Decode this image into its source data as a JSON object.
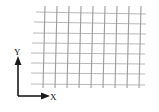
{
  "figure": {
    "title": "",
    "background_color": "#ffffff",
    "width": 159,
    "height": 112
  },
  "axes": {
    "origin": {
      "x": 18,
      "y": 96
    },
    "color": "#1a1a1a",
    "line_width": 1.6,
    "y_axis": {
      "label": "Y",
      "label_position": {
        "x": 14,
        "y": 55
      },
      "direction": "up",
      "arrow": "filled-triangle",
      "start": {
        "x": 18,
        "y": 96
      },
      "end": {
        "x": 18,
        "y": 60
      }
    },
    "x_axis": {
      "label": "X",
      "label_position": {
        "x": 50,
        "y": 100
      },
      "direction": "right",
      "arrow": "filled-triangle",
      "start": {
        "x": 18,
        "y": 96
      },
      "end": {
        "x": 46,
        "y": 96
      }
    }
  },
  "grid": {
    "description": "mesh-grid",
    "color_horizontal": "#b9b9b9",
    "color_vertical": "#9b9b9b",
    "line_width": 1.1,
    "horizontal_line_count": 8,
    "vertical_line_count": 9,
    "horizontal_lines": [
      {
        "x1": 36,
        "y1": 12,
        "x2": 146,
        "y2": 14
      },
      {
        "x1": 34,
        "y1": 22,
        "x2": 146,
        "y2": 24
      },
      {
        "x1": 33,
        "y1": 33,
        "x2": 146,
        "y2": 34
      },
      {
        "x1": 32,
        "y1": 43,
        "x2": 145,
        "y2": 44
      },
      {
        "x1": 31,
        "y1": 53,
        "x2": 145,
        "y2": 54
      },
      {
        "x1": 31,
        "y1": 63,
        "x2": 145,
        "y2": 64
      },
      {
        "x1": 31,
        "y1": 73,
        "x2": 145,
        "y2": 74
      },
      {
        "x1": 31,
        "y1": 84,
        "x2": 145,
        "y2": 85
      }
    ],
    "vertical_lines": [
      {
        "x1": 45,
        "y1": 6,
        "x2": 43,
        "y2": 88
      },
      {
        "x1": 57,
        "y1": 6,
        "x2": 55,
        "y2": 88
      },
      {
        "x1": 69,
        "y1": 6,
        "x2": 67,
        "y2": 88
      },
      {
        "x1": 81,
        "y1": 6,
        "x2": 79,
        "y2": 88
      },
      {
        "x1": 93,
        "y1": 6,
        "x2": 91,
        "y2": 88
      },
      {
        "x1": 105,
        "y1": 6,
        "x2": 103,
        "y2": 88
      },
      {
        "x1": 117,
        "y1": 6,
        "x2": 115,
        "y2": 88
      },
      {
        "x1": 129,
        "y1": 6,
        "x2": 127,
        "y2": 88
      },
      {
        "x1": 141,
        "y1": 6,
        "x2": 139,
        "y2": 88
      }
    ]
  }
}
